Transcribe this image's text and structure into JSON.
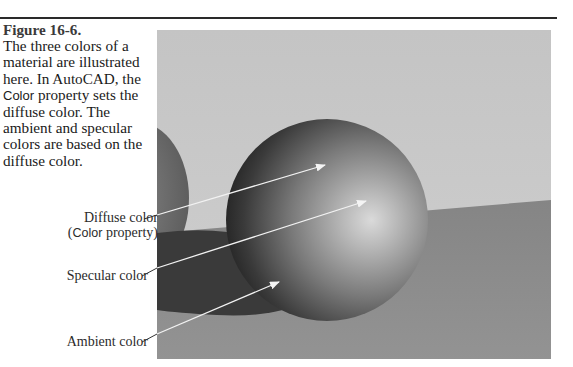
{
  "figure": {
    "label": "Figure 16-6.",
    "caption_line1": "The three colors of a material are illustrated here. In AutoCAD, the ",
    "caption_term": "Color",
    "caption_line2": " property sets the diffuse color. The ambient and specular colors are based on the diffuse color."
  },
  "callouts": {
    "diffuse_title": "Diffuse color",
    "diffuse_sub_open": "(",
    "diffuse_sub_term": "Color",
    "diffuse_sub_rest": " property)",
    "specular": "Specular color",
    "ambient": "Ambient color"
  },
  "colors": {
    "background_wall": "#c9c9c9",
    "floor": "#8a8a8a",
    "shadow": "#3c3c3c",
    "sphere_highlight": "#d8d8d8",
    "sphere_mid": "#8d8d8d",
    "sphere_dark": "#1e1e1e",
    "leader_line": "#f2f2f2",
    "rule": "#2a2a2a"
  }
}
